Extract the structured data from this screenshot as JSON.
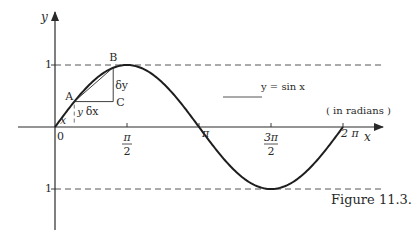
{
  "figure": {
    "caption": "Figure 11.3.",
    "equation_label": "y = sin x",
    "units_note": "( in radians )",
    "axis_labels": {
      "x": "x",
      "y": "y"
    },
    "y_tick_labels": {
      "pos_one": "1",
      "neg_one": "1"
    },
    "x_tick_labels": [
      {
        "num": "0",
        "den": ""
      },
      {
        "num": "π",
        "den": "2"
      },
      {
        "num": "π",
        "den": ""
      },
      {
        "num": "3π",
        "den": "2"
      },
      {
        "num": "2 π",
        "den": ""
      }
    ],
    "point_labels": {
      "A": "A",
      "B": "B",
      "C": "C"
    },
    "increment_labels": {
      "dx": "δx",
      "dy": "δy",
      "x": "x",
      "y": "y"
    }
  },
  "chart_data": {
    "type": "line",
    "title": "y = sin x",
    "xlabel": "x (in radians)",
    "ylabel": "y",
    "xlim": [
      0,
      6.2832
    ],
    "ylim": [
      -1,
      1
    ],
    "x_ticks": [
      0,
      1.5708,
      3.1416,
      4.7124,
      6.2832
    ],
    "x_tick_labels": [
      "0",
      "π/2",
      "π",
      "3π/2",
      "2π"
    ],
    "y_ticks": [
      -1,
      1
    ],
    "guide_lines": [
      1,
      -1
    ],
    "series": [
      {
        "name": "y = sin x",
        "function": "sin",
        "domain": [
          0,
          6.2832
        ]
      }
    ],
    "annotations": {
      "A": {
        "x": 0.42,
        "y": 0.41
      },
      "B": {
        "x": 1.27,
        "y": 0.96
      },
      "C": {
        "x": 1.27,
        "y": 0.41
      }
    }
  }
}
